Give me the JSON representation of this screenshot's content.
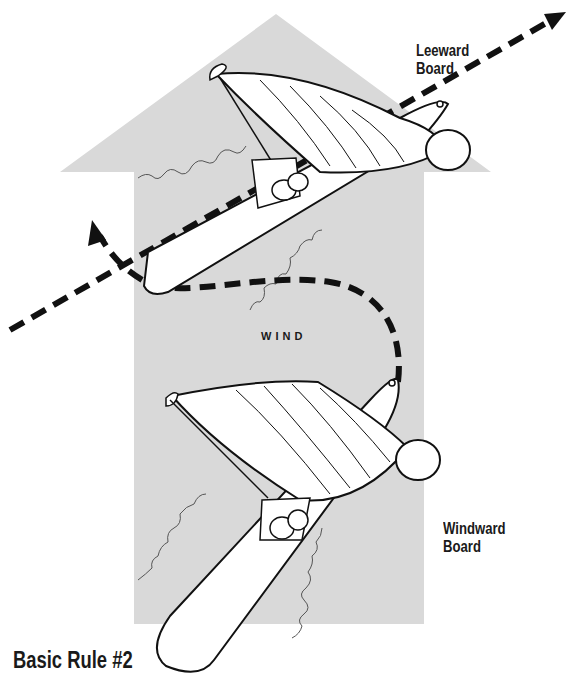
{
  "title": "Basic Rule #2",
  "labels": {
    "leeward": [
      "Leeward",
      "Board"
    ],
    "windward": [
      "Windward",
      "Board"
    ],
    "wind": "WIND"
  },
  "colors": {
    "wind_arrow": "#d9d9d9",
    "line": "#111111",
    "background": "#ffffff"
  },
  "elements": {
    "wind_arrow": "large gray upward arrow indicating wind direction",
    "leeward_board": "windsurfer on upper board with sail, heading right",
    "windward_board": "windsurfer on lower board with sail, coming from behind",
    "leeward_path": "dashed straight arrow heading up-right",
    "windward_path": "dashed curved arrow turning up-left, crossing behind leeward board"
  }
}
